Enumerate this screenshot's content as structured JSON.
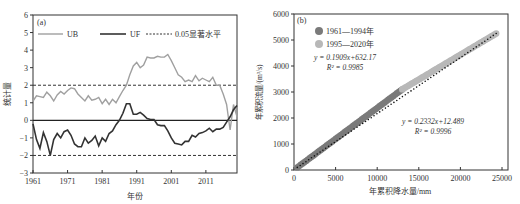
{
  "chart_data": [
    {
      "panel": "(a)",
      "type": "line",
      "title": "",
      "xlabel": "年份",
      "ylabel": "统计量",
      "xlim": [
        1961,
        2020
      ],
      "ylim": [
        -3,
        6
      ],
      "xticks": [
        1961,
        1971,
        1981,
        1991,
        2001,
        2011
      ],
      "yticks": [
        -3,
        -2,
        -1,
        0,
        1,
        2,
        3,
        4,
        5,
        6
      ],
      "grid": false,
      "legend": [
        "UB",
        "UF",
        "0.05显著水平"
      ],
      "legend_position": "top",
      "significance_levels": [
        2,
        -2
      ],
      "x": [
        1961,
        1962,
        1963,
        1964,
        1965,
        1966,
        1967,
        1968,
        1969,
        1970,
        1971,
        1972,
        1973,
        1974,
        1975,
        1976,
        1977,
        1978,
        1979,
        1980,
        1981,
        1982,
        1983,
        1984,
        1985,
        1986,
        1987,
        1988,
        1989,
        1990,
        1991,
        1992,
        1993,
        1994,
        1995,
        1996,
        1997,
        1998,
        1999,
        2000,
        2001,
        2002,
        2003,
        2004,
        2005,
        2006,
        2007,
        2008,
        2009,
        2010,
        2011,
        2012,
        2013,
        2014,
        2015,
        2016,
        2017,
        2018,
        2019,
        2020
      ],
      "series": [
        {
          "name": "UB",
          "color": "#a0a0a0",
          "values": [
            1.1,
            1.4,
            1.35,
            1.3,
            1.6,
            1.4,
            1.1,
            1.45,
            1.65,
            1.5,
            1.7,
            1.85,
            1.8,
            1.5,
            1.3,
            1.1,
            1.4,
            1.15,
            1.2,
            1.3,
            0.95,
            1.2,
            0.9,
            1.2,
            1.0,
            1.35,
            1.7,
            2.0,
            2.6,
            3.1,
            3.3,
            3.0,
            3.15,
            3.6,
            3.55,
            3.55,
            3.65,
            3.6,
            3.6,
            3.75,
            3.4,
            3.0,
            2.6,
            2.45,
            2.2,
            2.3,
            2.2,
            2.55,
            2.25,
            2.4,
            2.3,
            2.2,
            2.45,
            2.0,
            2.0,
            1.5,
            0.9,
            -0.55,
            0.9,
            0.2
          ]
        },
        {
          "name": "UF",
          "color": "#333333",
          "values": [
            -0.2,
            -1.1,
            -1.6,
            -0.7,
            -1.2,
            -2.0,
            -1.1,
            -0.75,
            -1.0,
            -0.65,
            -0.55,
            -0.85,
            -1.35,
            -1.5,
            -1.5,
            -1.0,
            -1.3,
            -1.15,
            -0.9,
            -1.45,
            -1.0,
            -1.2,
            -0.75,
            -0.6,
            -0.25,
            0.0,
            0.4,
            0.95,
            0.95,
            0.35,
            0.35,
            0.45,
            0.3,
            0.1,
            0.05,
            0.05,
            -0.25,
            -0.3,
            -0.3,
            -0.6,
            -1.0,
            -1.3,
            -1.35,
            -1.4,
            -1.2,
            -1.2,
            -0.85,
            -0.95,
            -0.75,
            -0.7,
            -0.6,
            -0.45,
            -0.65,
            -0.5,
            -0.5,
            -0.4,
            -0.1,
            0.2,
            0.6,
            0.85
          ]
        }
      ]
    },
    {
      "panel": "(b)",
      "type": "scatter",
      "title": "",
      "xlabel": "年累积降水量/mm",
      "ylabel": "年累积流量/(m³/s)",
      "xlim": [
        0,
        25000
      ],
      "ylim": [
        0,
        6000
      ],
      "xticks": [
        0,
        5000,
        10000,
        15000,
        20000,
        25000
      ],
      "yticks": [
        0,
        1000,
        2000,
        3000,
        4000,
        5000,
        6000
      ],
      "grid": false,
      "legend_position": "top-left",
      "series": [
        {
          "name": "1961—1994年",
          "color": "#7a7a7a",
          "x_range": [
            400,
            13000
          ],
          "y_range": [
            100,
            3100
          ],
          "fit": {
            "equation": "y = 0.2332x+12.489",
            "r2": "R² = 0.9996",
            "slope": 0.2332,
            "intercept": 12.489
          }
        },
        {
          "name": "1995—2020年",
          "color": "#b8b8b8",
          "x_range": [
            13000,
            24300
          ],
          "y_range": [
            3100,
            5250
          ],
          "fit": {
            "equation": "y = 0.1909x+632.17",
            "r2": "R² = 0.9985",
            "slope": 0.1909,
            "intercept": 632.17
          }
        }
      ]
    }
  ],
  "panel_a": {
    "label": "(a)",
    "legend": {
      "ub": "UB",
      "uf": "UF",
      "sig": "0.05显著水平"
    },
    "xlabel": "年份",
    "ylabel": "统计量"
  },
  "panel_b": {
    "label": "(b)",
    "legend": {
      "s1": "1961—1994年",
      "s2": "1995—2020年"
    },
    "eq1": "y = 0.1909x+632.17",
    "r2_1": "R² = 0.9985",
    "eq2": "y = 0.2332x+12.489",
    "r2_2": "R² = 0.9996",
    "xlabel": "年累积降水量/mm",
    "ylabel": "年累积流量/(m³/s)"
  }
}
